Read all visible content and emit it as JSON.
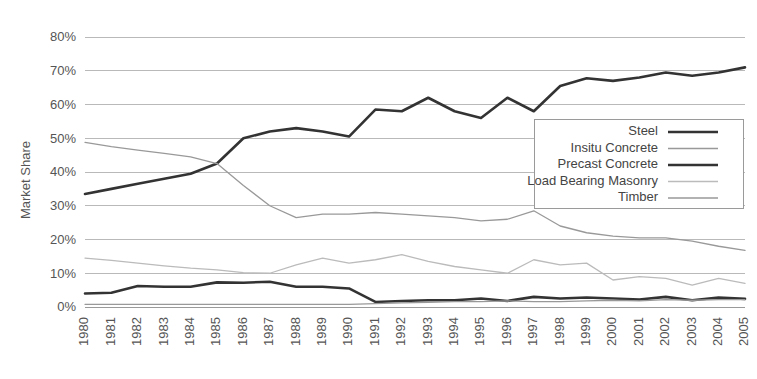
{
  "chart_data": {
    "type": "line",
    "title": "",
    "xlabel": "",
    "ylabel": "Market Share",
    "ylim": [
      0,
      80
    ],
    "ytick_labels": [
      "0%",
      "10%",
      "20%",
      "30%",
      "40%",
      "50%",
      "60%",
      "70%",
      "80%"
    ],
    "ytick_values": [
      0,
      10,
      20,
      30,
      40,
      50,
      60,
      70,
      80
    ],
    "grid": true,
    "legend_position": "top-right",
    "categories": [
      "1980",
      "1981",
      "1982",
      "1983",
      "1984",
      "1985",
      "1986",
      "1987",
      "1988",
      "1989",
      "1990",
      "1991",
      "1992",
      "1993",
      "1994",
      "1995",
      "1996",
      "1997",
      "1998",
      "1999",
      "2000",
      "2001",
      "2002",
      "2003",
      "2004",
      "2005"
    ],
    "series": [
      {
        "name": "Steel",
        "color": "#333333",
        "width": 2.6,
        "values": [
          33.5,
          35.0,
          36.5,
          38.0,
          39.5,
          42.5,
          50.0,
          52.0,
          53.0,
          52.0,
          50.5,
          58.5,
          58.0,
          62.0,
          58.0,
          56.0,
          62.0,
          58.0,
          65.5,
          67.8,
          67.0,
          68.0,
          69.5,
          68.5,
          69.5,
          71.0
        ]
      },
      {
        "name": "Insitu Concrete",
        "color": "#999999",
        "width": 1.3,
        "values": [
          48.8,
          47.5,
          46.5,
          45.5,
          44.5,
          42.5,
          36.0,
          30.0,
          26.5,
          27.5,
          27.5,
          28.0,
          27.5,
          27.0,
          26.5,
          25.5,
          26.0,
          28.5,
          24.0,
          22.0,
          21.0,
          20.5,
          20.5,
          19.5,
          18.0,
          16.8
        ]
      },
      {
        "name": "Precast Concrete",
        "color": "#333333",
        "width": 2.6,
        "values": [
          4.0,
          4.2,
          6.2,
          6.0,
          6.0,
          7.3,
          7.2,
          7.5,
          6.0,
          6.0,
          5.5,
          1.5,
          1.8,
          2.0,
          2.0,
          2.5,
          1.8,
          3.0,
          2.5,
          2.8,
          2.5,
          2.2,
          3.0,
          2.0,
          2.8,
          2.4
        ]
      },
      {
        "name": "Load Bearing Masonry",
        "color": "#bbbbbb",
        "width": 1.3,
        "values": [
          14.5,
          13.8,
          13.0,
          12.2,
          11.5,
          11.0,
          10.2,
          10.0,
          12.5,
          14.5,
          13.0,
          14.0,
          15.5,
          13.5,
          12.0,
          11.0,
          10.0,
          14.0,
          12.5,
          13.0,
          8.0,
          9.0,
          8.5,
          6.5,
          8.5,
          7.0
        ]
      },
      {
        "name": "Timber",
        "color": "#999999",
        "width": 1.3,
        "values": [
          0.8,
          0.8,
          0.8,
          0.8,
          0.8,
          0.8,
          0.8,
          0.8,
          0.8,
          0.8,
          0.8,
          1.0,
          1.2,
          1.4,
          1.6,
          1.6,
          1.8,
          1.6,
          1.6,
          1.8,
          2.0,
          1.8,
          2.2,
          2.0,
          2.2,
          2.2
        ]
      }
    ]
  },
  "legend": {
    "entries": [
      {
        "label": "Steel"
      },
      {
        "label": "Insitu Concrete"
      },
      {
        "label": "Precast Concrete"
      },
      {
        "label": "Load Bearing Masonry"
      },
      {
        "label": "Timber"
      }
    ]
  }
}
